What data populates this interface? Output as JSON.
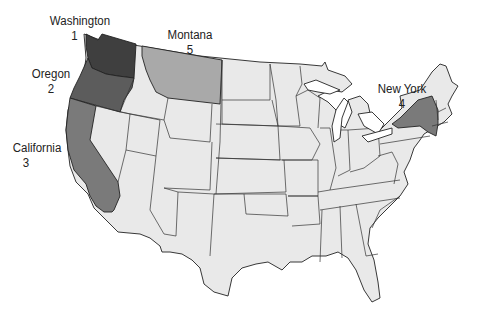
{
  "map": {
    "title": "United States",
    "colors": {
      "rank1": "#3f3f3f",
      "rank2": "#5c5c5c",
      "rank3": "#7a7a7a",
      "rank4": "#7a7a7a",
      "rank5": "#a9a9a9",
      "default": "#e9e9e9",
      "stroke": "#222222"
    },
    "labels": [
      {
        "state": "Washington",
        "rank": "1"
      },
      {
        "state": "Oregon",
        "rank": "2"
      },
      {
        "state": "California",
        "rank": "3"
      },
      {
        "state": "New York",
        "rank": "4"
      },
      {
        "state": "Montana",
        "rank": "5"
      }
    ]
  }
}
